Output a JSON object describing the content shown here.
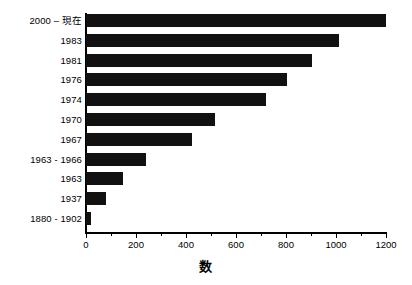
{
  "chart_data": {
    "type": "bar",
    "orientation": "horizontal",
    "title": "",
    "xlabel": "数",
    "ylabel": "",
    "categories": [
      "2000 – 現在",
      "1983",
      "1981",
      "1976",
      "1974",
      "1970",
      "1967",
      "1963 - 1966",
      "1963",
      "1937",
      "1880 - 1902"
    ],
    "values": [
      1200,
      1010,
      905,
      805,
      720,
      515,
      425,
      240,
      148,
      78,
      20
    ],
    "xlim": [
      0,
      1200
    ],
    "x_major_ticks": [
      0,
      200,
      400,
      600,
      800,
      1000,
      1200
    ],
    "x_major_tick_labels": [
      "0",
      "200",
      "400",
      "600",
      "800",
      "1000",
      "1200"
    ],
    "x_minor_ticks": [
      100,
      300,
      500,
      700,
      900,
      1100
    ],
    "grid": false,
    "legend": false,
    "bar_color": "#111111",
    "axis_color": "#000000",
    "background_color": "#ffffff"
  }
}
